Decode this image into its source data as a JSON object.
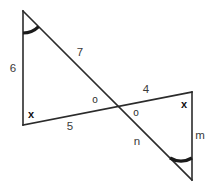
{
  "figure": {
    "background_color": "#ffffff",
    "stroke_color": "#2b2b2b",
    "label_color": "#3a3a3a"
  },
  "labels": {
    "left_vertical_side": "6",
    "long_diagonal_upper": "7",
    "lower_base_left": "5",
    "upper_base_right": "4",
    "long_diagonal_lower": "n",
    "right_vertical_side": "m"
  },
  "angle_marks": {
    "left_base_angle": "x",
    "right_top_angle": "x",
    "vertical_angle_left": "o",
    "vertical_angle_right": "o",
    "top_apex_arc": "arc-mark",
    "bottom_apex_arc": "arc-mark"
  },
  "points": {
    "top_apex": {
      "x": 23,
      "y": 11
    },
    "left_base": {
      "x": 23,
      "y": 125
    },
    "right_top": {
      "x": 192,
      "y": 92
    },
    "bottom_apex": {
      "x": 192,
      "y": 180
    },
    "crossing": {
      "x": 115,
      "y": 106
    }
  }
}
